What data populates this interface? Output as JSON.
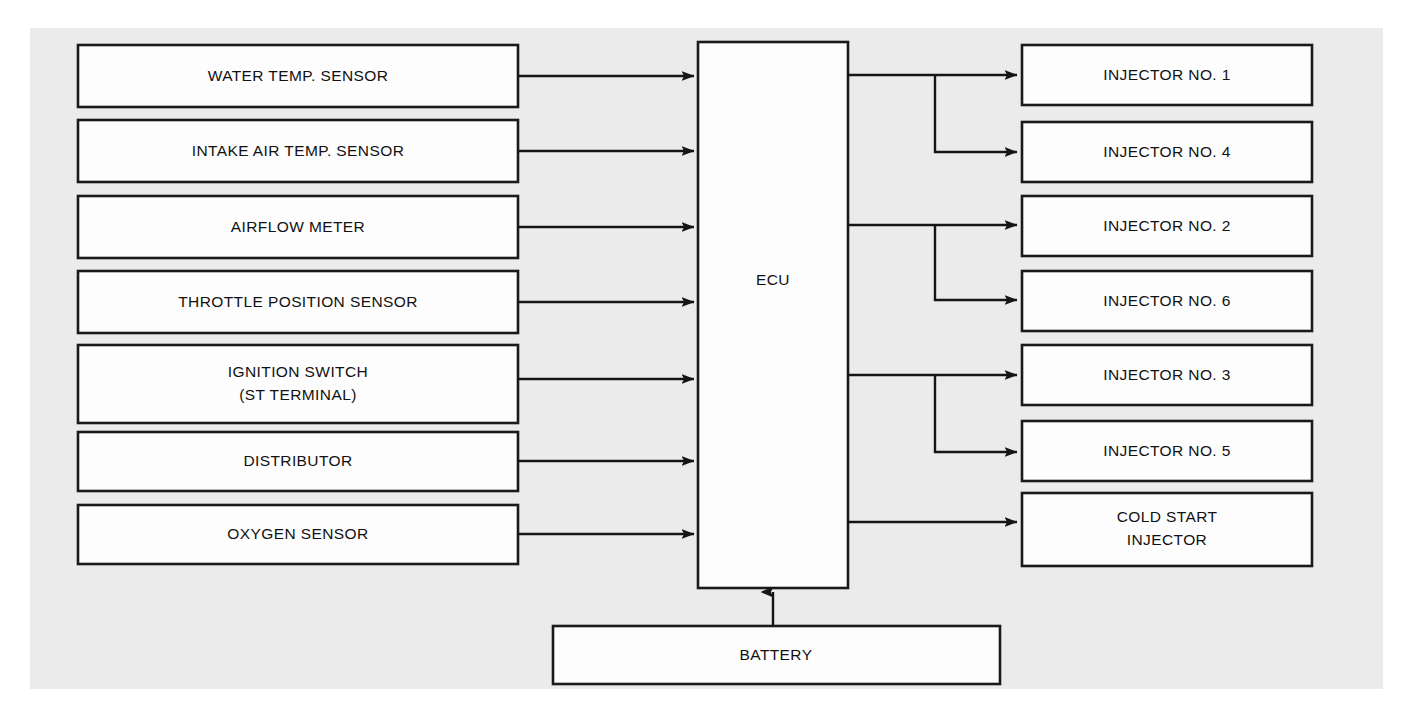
{
  "diagram": {
    "type": "block-diagram",
    "title_text_visible": false,
    "background_panel_color": "#ebebeb",
    "line_color": "#151515",
    "box_fill_color": "#fdfdfd",
    "inputs": [
      {
        "id": "water-temp-sensor",
        "label": "WATER TEMP. SENSOR"
      },
      {
        "id": "intake-air-temp-sensor",
        "label": "INTAKE AIR TEMP. SENSOR"
      },
      {
        "id": "airflow-meter",
        "label": "AIRFLOW METER"
      },
      {
        "id": "throttle-position-sensor",
        "label": "THROTTLE POSITION SENSOR"
      },
      {
        "id": "ignition-switch",
        "label": "IGNITION SWITCH",
        "label_line2": "(ST TERMINAL)"
      },
      {
        "id": "distributor",
        "label": "DISTRIBUTOR"
      },
      {
        "id": "oxygen-sensor",
        "label": "OXYGEN SENSOR"
      }
    ],
    "controller": {
      "id": "ecu",
      "label": "ECU"
    },
    "power": {
      "id": "battery",
      "label": "BATTERY"
    },
    "outputs": [
      {
        "id": "injector-no-1",
        "label": "INJECTOR NO. 1"
      },
      {
        "id": "injector-no-4",
        "label": "INJECTOR NO. 4"
      },
      {
        "id": "injector-no-2",
        "label": "INJECTOR NO. 2"
      },
      {
        "id": "injector-no-6",
        "label": "INJECTOR NO. 6"
      },
      {
        "id": "injector-no-3",
        "label": "INJECTOR NO. 3"
      },
      {
        "id": "injector-no-5",
        "label": "INJECTOR NO. 5"
      },
      {
        "id": "cold-start-injector",
        "label": "COLD START",
        "label_line2": "INJECTOR"
      }
    ]
  }
}
